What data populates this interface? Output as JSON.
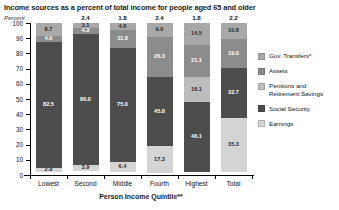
{
  "chart_data": {
    "type": "bar",
    "subtype": "stacked-bar-100-percent",
    "title": "Income sources as a percent of total income for people aged 65 and older",
    "ylabel": "Percent",
    "xlabel": "Person Income Quintile**",
    "ylim": [
      0,
      100
    ],
    "yticks": [
      100,
      90,
      80,
      70,
      60,
      50,
      40,
      30,
      20,
      10,
      0
    ],
    "grid": false,
    "legend_position": "right",
    "categories": [
      "Lowest",
      "Second",
      "Middle",
      "Fourth",
      "Highest",
      "Total"
    ],
    "series": [
      {
        "name": "Gov. Transfers*",
        "color": "#a8a8a8",
        "values": [
          8.7,
          3.1,
          4.6,
          9.0,
          14.5,
          10.8
        ],
        "labels": [
          "8.7",
          "3.1",
          "4.6",
          "9.0",
          "14.5",
          "10.8"
        ]
      },
      {
        "name": "Assets",
        "color": "#8c8c8c",
        "values": [
          4.0,
          4.3,
          11.8,
          26.3,
          21.1,
          19.0
        ],
        "labels": [
          "4.0",
          "4.3",
          "11.8",
          "26.3",
          "21.1",
          "19.0"
        ]
      },
      {
        "name": "Pensions and Retirement Savings",
        "color": "#bdbdbd",
        "values": [
          0.0,
          0.0,
          0.0,
          0.0,
          16.1,
          0.0
        ],
        "labels": [
          "",
          "",
          "",
          "",
          "16.1",
          ""
        ]
      },
      {
        "name": "Social Security",
        "color": "#4d4d4d",
        "values": [
          82.5,
          86.0,
          75.0,
          45.8,
          46.1,
          32.7
        ],
        "labels": [
          "82.5",
          "86.0",
          "75.0",
          "45.8",
          "46.1",
          "32.7"
        ]
      },
      {
        "name": "Earnings",
        "color": "#d4d4d4",
        "values": [
          2.9,
          3.9,
          6.4,
          17.3,
          0.0,
          35.3
        ],
        "labels": [
          "2.9",
          "3.9",
          "6.4",
          "17.3",
          "",
          "35.3"
        ]
      }
    ],
    "top_annotations": [
      "",
      "2.4",
      "1.8",
      "2.4",
      "1.8",
      "2.2"
    ]
  },
  "legend": {
    "items": [
      {
        "label": "Gov. Transfers*",
        "color": "#a8a8a8"
      },
      {
        "label": "Assets",
        "color": "#8c8c8c"
      },
      {
        "label": "Pensions and\nRetirement Savings",
        "color": "#bdbdbd"
      },
      {
        "label": "Social Security",
        "color": "#4d4d4d"
      },
      {
        "label": "Earnings",
        "color": "#d4d4d4"
      }
    ]
  }
}
